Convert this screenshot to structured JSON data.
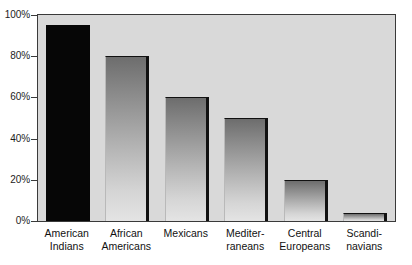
{
  "chart_data": {
    "type": "bar",
    "title": "",
    "subtitle": "",
    "xlabel": "",
    "ylabel": "",
    "categories": [
      "American Indians",
      "African Americans",
      "Mexicans",
      "Mediterraneans",
      "Central Europeans",
      "Scandinavians"
    ],
    "category_lines": [
      [
        "American",
        "Indians"
      ],
      [
        "African",
        "Americans"
      ],
      [
        "Mexicans",
        ""
      ],
      [
        "Mediter-",
        "raneans"
      ],
      [
        "Central",
        "Europeans"
      ],
      [
        "Scandi-",
        "navians"
      ]
    ],
    "values": [
      95,
      80,
      60,
      50,
      20,
      4
    ],
    "ylim": [
      0,
      100
    ],
    "ytick_values": [
      0,
      20,
      40,
      60,
      80,
      100
    ],
    "ytick_labels": [
      "0%",
      "20%",
      "40%",
      "60%",
      "80%",
      "100%"
    ],
    "grid": false,
    "legend": null,
    "bar_styles": [
      "solid-black",
      "gradient",
      "gradient",
      "gradient",
      "gradient",
      "gradient"
    ],
    "colors": {
      "plot_background": "#d9d9d9",
      "plot_border": "#3a3a3a",
      "bar_solid": "#060606",
      "bar_gradient_top": "#6d6d6d",
      "bar_gradient_bottom": "#e4e4e4",
      "bar_shadow_edge": "#111111",
      "text": "#1c1c1c",
      "page_background": "#ffffff"
    }
  }
}
